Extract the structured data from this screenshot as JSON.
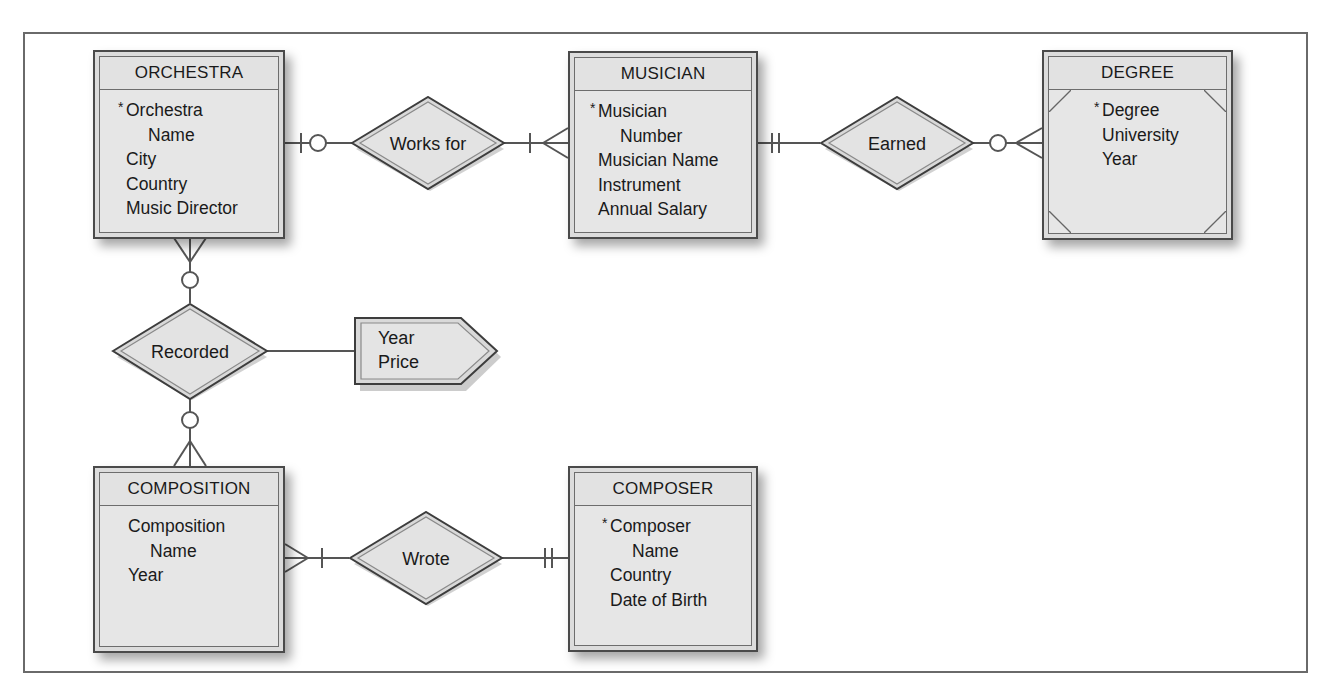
{
  "diagram": {
    "type": "entity-relationship",
    "notation": "crow's foot",
    "entities": [
      {
        "id": "orchestra",
        "name": "ORCHESTRA",
        "attributes": [
          {
            "text": "Orchestra",
            "key": true
          },
          {
            "text": "Name",
            "continuation": true
          },
          {
            "text": "City"
          },
          {
            "text": "Country"
          },
          {
            "text": "Music Director"
          }
        ]
      },
      {
        "id": "musician",
        "name": "MUSICIAN",
        "attributes": [
          {
            "text": "Musician",
            "key": true
          },
          {
            "text": "Number",
            "continuation": true
          },
          {
            "text": "Musician Name"
          },
          {
            "text": "Instrument"
          },
          {
            "text": "Annual Salary"
          }
        ]
      },
      {
        "id": "degree",
        "name": "DEGREE",
        "weak": true,
        "attributes": [
          {
            "text": "Degree",
            "key": true
          },
          {
            "text": "University"
          },
          {
            "text": "Year"
          }
        ]
      },
      {
        "id": "composition",
        "name": "COMPOSITION",
        "attributes": [
          {
            "text": "Composition"
          },
          {
            "text": "Name",
            "continuation": true
          },
          {
            "text": "Year"
          }
        ]
      },
      {
        "id": "composer",
        "name": "COMPOSER",
        "attributes": [
          {
            "text": "Composer",
            "key": true
          },
          {
            "text": "Name",
            "continuation": true
          },
          {
            "text": "Country"
          },
          {
            "text": "Date of Birth"
          }
        ]
      }
    ],
    "relationships": [
      {
        "id": "works_for",
        "label": "Works for",
        "from": "orchestra",
        "from_cardinality": "one, optional (|O)",
        "to": "musician",
        "to_cardinality": "many, mandatory (|<)"
      },
      {
        "id": "earned",
        "label": "Earned",
        "from": "musician",
        "from_cardinality": "exactly one (||)",
        "to": "degree",
        "to_cardinality": "many, optional (O<)"
      },
      {
        "id": "recorded",
        "label": "Recorded",
        "from": "orchestra",
        "from_cardinality": "many, optional (O<)",
        "to": "composition",
        "to_cardinality": "many, optional (O<)",
        "associative_attributes": [
          "Year",
          "Price"
        ]
      },
      {
        "id": "wrote",
        "label": "Wrote",
        "from": "composition",
        "from_cardinality": "many, mandatory (|<)",
        "to": "composer",
        "to_cardinality": "exactly one (||)"
      }
    ],
    "associative_box": {
      "attributes": [
        "Year",
        "Price"
      ]
    }
  }
}
